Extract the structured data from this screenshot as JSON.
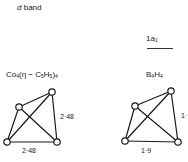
{
  "header": {
    "band_label": "d band",
    "band_symbol": "d",
    "band_word": "band"
  },
  "orbital": {
    "label": "1a1",
    "base": "1a",
    "sub": "1"
  },
  "molecules": [
    {
      "name": "Co4(η-C5H5)4",
      "parts": {
        "co": "Co",
        "co_sub": "4",
        "mid": "(η − C",
        "c_sub": "5",
        "h": "H",
        "h_sub": "5",
        "close": ")",
        "close_sub": "4"
      },
      "distances": {
        "side": "2·48",
        "bottom": "2·48"
      },
      "nodes": [
        [
          52,
          92
        ],
        [
          19,
          107
        ],
        [
          7,
          142
        ],
        [
          57,
          142
        ]
      ]
    },
    {
      "name": "B4H4",
      "parts": {
        "b": "B",
        "b_sub": "4",
        "h": "H",
        "h_sub": "4"
      },
      "distances": {
        "side": "1·",
        "bottom": "1·9"
      },
      "nodes": [
        [
          171,
          91
        ],
        [
          135,
          106
        ],
        [
          125,
          141
        ],
        [
          178,
          142
        ]
      ]
    }
  ]
}
